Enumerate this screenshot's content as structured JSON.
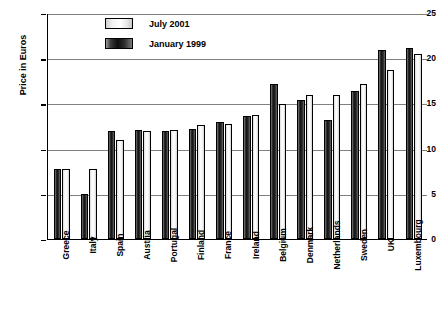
{
  "chart_data": {
    "type": "bar",
    "title": "",
    "xlabel": "",
    "ylabel": "Price in Euros",
    "ylim": [
      0,
      25
    ],
    "yticks": [
      0,
      5,
      10,
      15,
      20,
      25
    ],
    "grid": true,
    "legend_position": "top-center",
    "categories": [
      "Greece",
      "Italy",
      "Spain",
      "Austria",
      "Portugal",
      "Finland",
      "France",
      "Ireland",
      "Belgium",
      "Denmark",
      "Netherlands",
      "Sweden",
      "UK",
      "Luxembourg"
    ],
    "series": [
      {
        "name": "January 1999",
        "color": "#111111",
        "values": [
          7.7,
          5.0,
          11.9,
          12.1,
          12.0,
          12.2,
          12.9,
          13.6,
          17.2,
          15.4,
          13.2,
          16.4,
          20.9,
          21.1
        ]
      },
      {
        "name": "July 2001",
        "color": "#ffffff",
        "values": [
          7.7,
          7.7,
          11.0,
          11.9,
          12.1,
          12.6,
          12.7,
          13.7,
          14.9,
          15.9,
          15.9,
          17.2,
          18.7,
          20.5
        ]
      }
    ]
  },
  "axis": {
    "y_title": "Price in Euros",
    "y_ticks": [
      "0",
      "5",
      "10",
      "15",
      "20",
      "25"
    ]
  },
  "legend": {
    "items": [
      {
        "label": "July 2001",
        "swatch": "light-gradient-swatch"
      },
      {
        "label": "January 1999",
        "swatch": "dark-gradient-swatch"
      }
    ]
  }
}
